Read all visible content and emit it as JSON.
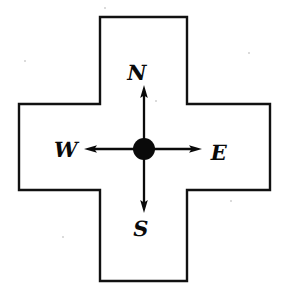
{
  "diagram": {
    "type": "vector-line-drawing",
    "background_color": "#ffffff",
    "stroke_color": "#111111",
    "fill_color": "#ffffff",
    "shape": {
      "name": "greek-cross-outline",
      "stroke_width": 2.4,
      "bounds": {
        "x": 19,
        "y": 17,
        "width": 251,
        "height": 264
      },
      "arm_edges": {
        "left": 100,
        "right": 187,
        "top": 104,
        "bottom": 190
      }
    },
    "hub": {
      "name": "center-dot",
      "cx": 144,
      "cy": 149,
      "r": 11,
      "color": "#0a0a0a"
    },
    "arrows": [
      {
        "name": "north-arrow",
        "direction": "north",
        "from_x": 144,
        "from_y": 149,
        "to_x": 144,
        "to_y": 86
      },
      {
        "name": "south-arrow",
        "direction": "south",
        "from_x": 144,
        "from_y": 149,
        "to_x": 144,
        "to_y": 212
      },
      {
        "name": "west-arrow",
        "direction": "west",
        "from_x": 144,
        "from_y": 149,
        "to_x": 85,
        "to_y": 149
      },
      {
        "name": "east-arrow",
        "direction": "east",
        "from_x": 144,
        "from_y": 149,
        "to_x": 202,
        "to_y": 149
      }
    ],
    "labels": {
      "north": "N",
      "west": "W",
      "east": "E",
      "south": "S"
    }
  }
}
